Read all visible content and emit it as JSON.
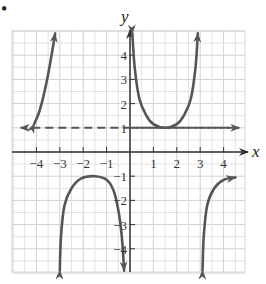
{
  "marker": "•",
  "chart_data": {
    "type": "line",
    "title": "",
    "xlabel": "x",
    "ylabel": "y",
    "xlim": [
      -5,
      5
    ],
    "ylim": [
      -5,
      5
    ],
    "grid": true,
    "x_ticks": [
      -4,
      -3,
      -2,
      -1,
      1,
      2,
      3,
      4
    ],
    "y_ticks": [
      4,
      3,
      2,
      1,
      -1,
      -2,
      -3,
      -4
    ],
    "x_tick_labels": [
      "−4",
      "−3",
      "−2",
      "−1",
      "1",
      "2",
      "3",
      "4"
    ],
    "y_tick_labels": [
      "4",
      "3",
      "2",
      "1",
      "−1",
      "−2",
      "−3",
      "−4"
    ],
    "asymptotes": [
      {
        "type": "horizontal",
        "y": 1,
        "style": "dashed",
        "x_range": [
          -4.5,
          4.5
        ]
      }
    ],
    "series": [
      {
        "name": "left-upper-branch",
        "points": [
          [
            -4.1,
            1.15
          ],
          [
            -3.9,
            1.6
          ],
          [
            -3.7,
            2.3
          ],
          [
            -3.5,
            3.2
          ],
          [
            -3.3,
            4.3
          ],
          [
            -3.2,
            4.9
          ]
        ]
      },
      {
        "name": "middle-u-branch",
        "points": [
          [
            0.1,
            4.9
          ],
          [
            0.2,
            3.5
          ],
          [
            0.4,
            2.2
          ],
          [
            0.7,
            1.5
          ],
          [
            1.0,
            1.15
          ],
          [
            1.5,
            1.0
          ],
          [
            2.0,
            1.15
          ],
          [
            2.3,
            1.5
          ],
          [
            2.6,
            2.2
          ],
          [
            2.8,
            3.5
          ],
          [
            2.9,
            4.9
          ]
        ]
      },
      {
        "name": "lower-n-branch",
        "points": [
          [
            -3.0,
            -4.9
          ],
          [
            -2.95,
            -3.5
          ],
          [
            -2.8,
            -2.2
          ],
          [
            -2.5,
            -1.5
          ],
          [
            -2.1,
            -1.1
          ],
          [
            -1.5,
            -1.0
          ],
          [
            -1.0,
            -1.15
          ],
          [
            -0.7,
            -1.6
          ],
          [
            -0.5,
            -2.4
          ],
          [
            -0.35,
            -3.5
          ],
          [
            -0.25,
            -4.9
          ]
        ]
      },
      {
        "name": "right-lower-branch",
        "points": [
          [
            3.1,
            -4.9
          ],
          [
            3.15,
            -3.5
          ],
          [
            3.3,
            -2.2
          ],
          [
            3.6,
            -1.5
          ],
          [
            4.0,
            -1.15
          ],
          [
            4.5,
            -1.05
          ]
        ]
      }
    ]
  }
}
